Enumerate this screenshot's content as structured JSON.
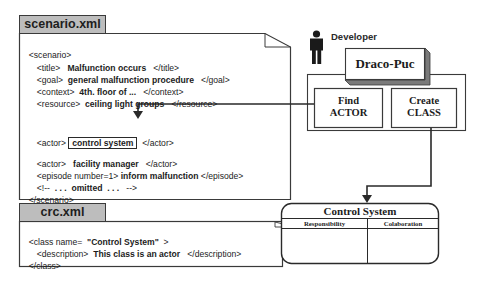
{
  "scenario_file": {
    "tab_label": "scenario.xml",
    "lines": [
      {
        "tag_open": "<scenario>",
        "value": "",
        "tag_close": ""
      },
      {
        "tag_open": "<title>",
        "value": "Malfunction occurs",
        "tag_close": "</title>"
      },
      {
        "tag_open": "<goal>",
        "value": "general malfunction procedure",
        "tag_close": "</goal>"
      },
      {
        "tag_open": "<context>",
        "value": "4th. floor of ...",
        "tag_close": "</context>"
      },
      {
        "tag_open": "<resource>",
        "value": "ceiling light groups",
        "tag_close": "</resource>"
      },
      {
        "tag_open": "<actor>",
        "value": "control system",
        "tag_close": "</actor>",
        "highlighted": true
      },
      {
        "tag_open": "<actor>",
        "value": "facility manager",
        "tag_close": "</actor>"
      },
      {
        "tag_open": "<episode number=1>",
        "value": "inform malfunction",
        "tag_close": "</episode>"
      },
      {
        "tag_open": "<!--",
        "value": ". . .  omitted  . . .",
        "tag_close": "-->"
      },
      {
        "tag_open": "</scenario>",
        "value": "",
        "tag_close": ""
      }
    ]
  },
  "crc_file": {
    "tab_label": "crc.xml",
    "lines": [
      {
        "tag_open": "<class name=",
        "value": "\"Control System\"",
        "tag_close": ">"
      },
      {
        "tag_open": "<description>",
        "value": "This class is an actor",
        "tag_close": "</description>"
      },
      {
        "tag_open": "</class>",
        "value": "",
        "tag_close": ""
      }
    ]
  },
  "developer": {
    "label": "Developer",
    "icon": "person-icon"
  },
  "tool": {
    "name": "Draco-Puc",
    "functions": [
      {
        "line1": "Find",
        "line2": "ACTOR"
      },
      {
        "line1": "Create",
        "line2": "CLASS"
      }
    ]
  },
  "crc_card": {
    "title": "Control System",
    "columns": [
      "Responsibility",
      "Colaboration"
    ]
  },
  "colors": {
    "tab_fill": "#bdbdbd",
    "line": "#2a2a2a",
    "shadow": "#6e6e6e",
    "background": "#ffffff"
  }
}
